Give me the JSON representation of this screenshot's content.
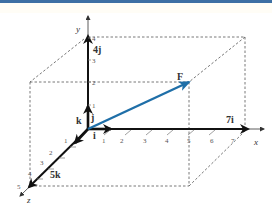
{
  "diagram": {
    "title": "",
    "axes": {
      "x": {
        "label": "x",
        "ticks": [
          "1",
          "2",
          "3",
          "4",
          "5",
          "6",
          "7"
        ]
      },
      "y": {
        "label": "y",
        "ticks": [
          "1",
          "2",
          "3",
          "4"
        ]
      },
      "z": {
        "label": "z",
        "ticks": [
          "1",
          "2",
          "3",
          "4",
          "5"
        ]
      }
    },
    "unit_vectors": {
      "i": "i",
      "j": "j",
      "k": "k"
    },
    "components": {
      "x": "7i",
      "y": "4j",
      "z": "5k"
    },
    "resultant": {
      "label": "F",
      "color": "#1f6fa8",
      "components": [
        7,
        4,
        5
      ]
    },
    "colors": {
      "axis": "#111111",
      "box": "#555555",
      "force": "#1f6fa8",
      "topbar": "#3d6fa3"
    }
  }
}
